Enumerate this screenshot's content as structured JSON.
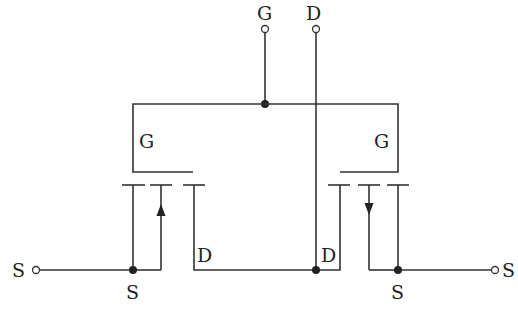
{
  "diagram": {
    "type": "circuit-schematic",
    "terminals": {
      "gate_top": "G",
      "drain_top": "D",
      "source_left": "S",
      "source_right": "S"
    },
    "labels": {
      "left_gate": "G",
      "right_gate": "G",
      "left_drain": "D",
      "right_drain": "D",
      "left_source": "S",
      "right_source": "S"
    },
    "transistors": [
      {
        "name": "left-mosfet",
        "arrow": "up",
        "gate": "G",
        "drain": "D",
        "source": "S"
      },
      {
        "name": "right-mosfet",
        "arrow": "down",
        "gate": "G",
        "drain": "D",
        "source": "S"
      }
    ],
    "colors": {
      "line": "#333333",
      "background": "#ffffff"
    }
  }
}
